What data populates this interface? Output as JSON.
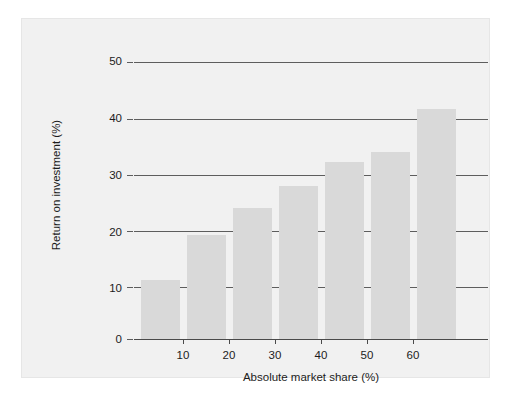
{
  "chart_data": {
    "type": "bar",
    "title": "",
    "subtitle": "",
    "xlabel": "Absolute market share (%)",
    "ylabel": "Return on investment (%)",
    "categories": [
      "5",
      "15",
      "25",
      "35",
      "45",
      "55",
      "65"
    ],
    "values": [
      10.7,
      18.7,
      23.7,
      27.7,
      32.0,
      33.7,
      41.6
    ],
    "x": [
      5,
      15,
      25,
      35,
      45,
      55,
      65
    ],
    "xlim": [
      0,
      70
    ],
    "ylim": [
      0,
      50
    ],
    "xticks": [
      10,
      20,
      30,
      40,
      50,
      60
    ],
    "yticks": [
      0,
      10,
      20,
      30,
      40,
      50
    ],
    "xtick_labels": [
      "10",
      "20",
      "30",
      "40",
      "50",
      "60"
    ],
    "ytick_labels": [
      "0",
      "10",
      "20",
      "30",
      "40",
      "50"
    ],
    "grid": true,
    "grid_axis": "y",
    "legend": null,
    "legend_position": "none",
    "annotations": [],
    "bar_color": "#d9d9d9",
    "grid_color": "#5d5d5d",
    "axis_color": "#4a4a4a",
    "panel_background": "#f1f1f1",
    "figure_background": "#ffffff",
    "text_color": "#1c1c1c"
  }
}
